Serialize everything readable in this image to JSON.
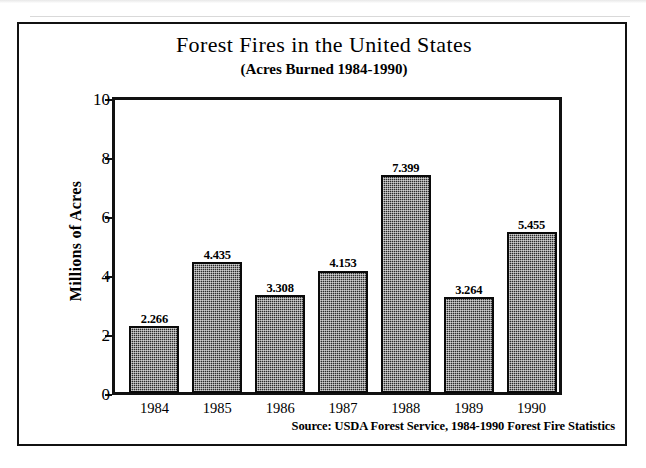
{
  "chart_data": {
    "type": "bar",
    "title": "Forest Fires in the United States",
    "subtitle": "(Acres Burned 1984-1990)",
    "xlabel": "",
    "ylabel": "Millions of Acres",
    "categories": [
      "1984",
      "1985",
      "1986",
      "1987",
      "1988",
      "1989",
      "1990"
    ],
    "values": [
      2.266,
      4.435,
      3.308,
      4.153,
      7.399,
      3.264,
      5.455
    ],
    "value_labels": [
      "2.266",
      "4.435",
      "3.308",
      "4.153",
      "7.399",
      "3.264",
      "5.455"
    ],
    "ylim": [
      0,
      10
    ],
    "yticks": [
      0,
      2,
      4,
      6,
      8,
      10
    ],
    "ytick_labels": [
      "0",
      "2",
      "4",
      "6",
      "8",
      "10"
    ],
    "grid": false,
    "legend": "none",
    "bar_color": "#2b2b2b",
    "bar_edge_color": "#0a0a0a",
    "background_color": "#ffffff",
    "axis_color": "#111111",
    "source_note": "Source: USDA Forest Service, 1984-1990 Forest Fire Statistics"
  }
}
